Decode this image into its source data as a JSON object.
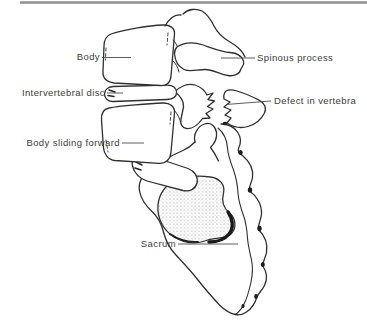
{
  "figure": {
    "kind": "medical line illustration",
    "subject_visible_labels_count": 6
  },
  "colors": {
    "background": "#ffffff",
    "line_art": "#2f2f2f",
    "label_text": "#3d3d3d",
    "leader_line": "#4a4a4a",
    "top_rule": "#8f8f8f",
    "stipple": "#6a6a6a"
  },
  "annotations": [
    {
      "id": "body",
      "text": "Body"
    },
    {
      "id": "spinous-process",
      "text": "Spinous process"
    },
    {
      "id": "intervertebral-disc",
      "text": "Intervertebral disc"
    },
    {
      "id": "defect-in-vertebra",
      "text": "Defect in vertebra"
    },
    {
      "id": "body-sliding-forward",
      "text": "Body sliding forward"
    },
    {
      "id": "sacrum",
      "text": "Sacrum"
    }
  ]
}
